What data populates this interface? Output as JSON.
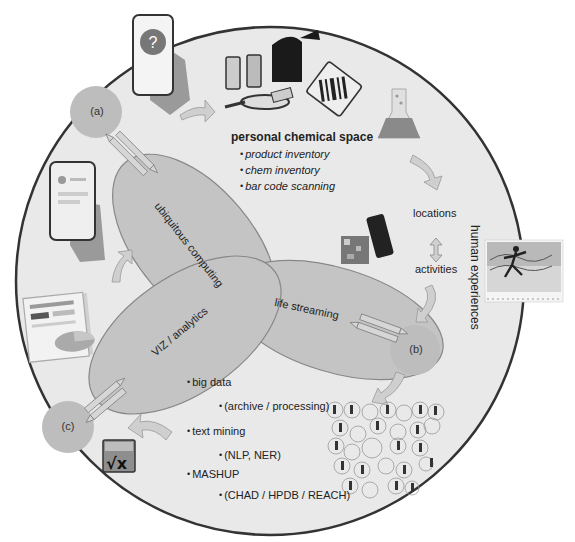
{
  "diagram": {
    "nodes": {
      "a": "(a)",
      "b": "(b)",
      "c": "(c)"
    },
    "ellipses": {
      "ubiquitous": "ubiquitous computing",
      "life": "life streaming",
      "viz": "VIZ / analytics"
    },
    "personal_chemical_space": {
      "title": "personal chemical space",
      "items": [
        "product inventory",
        "chem inventory",
        "bar code scanning"
      ]
    },
    "streams": {
      "locations": "locations",
      "activities": "activities",
      "human_experiences": "human experiences"
    },
    "analytics_list": {
      "items": [
        {
          "label": "big data",
          "sub": "(archive / processing)"
        },
        {
          "label": "text mining",
          "sub": "(NLP, NER)"
        },
        {
          "label": "MASHUP",
          "sub": "(CHAD / HPDB / REACH)"
        }
      ]
    },
    "icons": [
      "phone-question-icon",
      "chemical-products-icon",
      "barcode-icon",
      "flask-icon",
      "qr-phone-icon",
      "runner-chart-icon",
      "people-network-icon",
      "sqrt-x-icon",
      "report-chart-icon",
      "phone-hand-icon"
    ],
    "colors": {
      "background_circle": "#e9e9e9",
      "circle_border": "#333333",
      "ellipse_fill": "#c2c2c2",
      "node_fill": "#bdbdbd",
      "arrow_fill": "#cfcfcf"
    }
  }
}
